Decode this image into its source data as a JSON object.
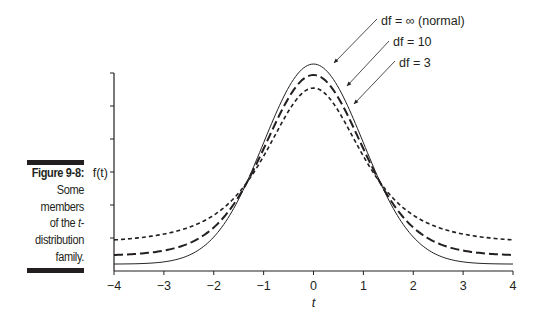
{
  "caption": {
    "figure_label": "Figure 9-8:",
    "lines": [
      "Some",
      "members",
      "of the ",
      "distribution",
      "family."
    ],
    "italic_t": "t",
    "hyphen": "-"
  },
  "chart_data": {
    "type": "line",
    "xlabel": "t",
    "ylabel": "f(t)",
    "xlim": [
      -4,
      4
    ],
    "xticks": [
      -4,
      -3,
      -2,
      -1,
      0,
      1,
      2,
      3,
      4
    ],
    "xtick_labels": [
      "−4",
      "−3",
      "−2",
      "−1",
      "0",
      "1",
      "2",
      "3",
      "4"
    ],
    "yticks_unlabeled": 6,
    "grid": false,
    "legend_position": "annotations with arrows, upper right of peak",
    "x": [
      -4,
      -3,
      -2,
      -1,
      0,
      1,
      2,
      3,
      4
    ],
    "series": [
      {
        "name": "df = ∞ (normal)",
        "df": "inf",
        "style": "solid",
        "values": [
          0.0001,
          0.0044,
          0.054,
          0.242,
          0.399,
          0.242,
          0.054,
          0.0044,
          0.0001
        ]
      },
      {
        "name": "df = 10",
        "df": 10,
        "style": "long-dash",
        "values": [
          0.002,
          0.0114,
          0.061,
          0.23,
          0.389,
          0.23,
          0.061,
          0.0114,
          0.002
        ]
      },
      {
        "name": "df = 3",
        "df": 3,
        "style": "short-dash",
        "values": [
          0.0042,
          0.023,
          0.068,
          0.207,
          0.368,
          0.207,
          0.068,
          0.023,
          0.0042
        ]
      }
    ],
    "annotations": [
      "df = ∞ (normal)",
      "df = 10",
      "df = 3"
    ]
  },
  "colors": {
    "ink": "#231f20",
    "background": "#ffffff"
  }
}
